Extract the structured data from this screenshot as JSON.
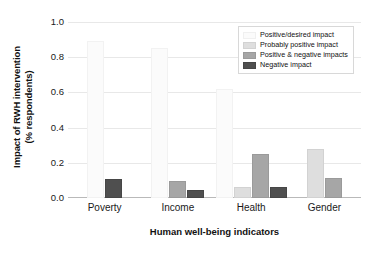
{
  "chart_data": {
    "type": "bar",
    "title": "",
    "subtitle": "",
    "xlabel": "Human well-being indicators",
    "ylabel": "Impact of RWH intervention\n(% respondents)",
    "categories": [
      "Poverty",
      "Income",
      "Health",
      "Gender"
    ],
    "series": [
      {
        "name": "Positive/desired impact",
        "color": "#fbfbfb",
        "values": [
          0.89,
          0.85,
          0.62,
          0.0
        ]
      },
      {
        "name": "Probably positive impact",
        "color": "#dedede",
        "values": [
          0.0,
          0.0,
          0.065,
          0.28
        ]
      },
      {
        "name": "Positive & negative impacts",
        "color": "#a6a6a6",
        "values": [
          0.0,
          0.095,
          0.25,
          0.115
        ]
      },
      {
        "name": "Negative impact",
        "color": "#4f4f4f",
        "values": [
          0.11,
          0.045,
          0.065,
          0.0
        ]
      }
    ],
    "ylim": [
      0.0,
      1.0
    ],
    "yticks": [
      "1.0",
      "0.8",
      "0.6",
      "0.4",
      "0.2",
      "0.0"
    ],
    "ytick_values": [
      1.0,
      0.8,
      0.6,
      0.4,
      0.2,
      0.0
    ],
    "grid": true,
    "grid_axis": "y",
    "legend_position": "top-right",
    "bar_group_mode": "grouped"
  },
  "axes": {
    "ylabel_line1": "Impact of RWH intervention",
    "ylabel_line2": "(% respondents)",
    "xlabel": "Human well-being indicators"
  },
  "legend": {
    "items": [
      {
        "label": "Positive/desired impact"
      },
      {
        "label": "Probably positive impact"
      },
      {
        "label": "Positive & negative impacts"
      },
      {
        "label": "Negative impact"
      }
    ]
  }
}
